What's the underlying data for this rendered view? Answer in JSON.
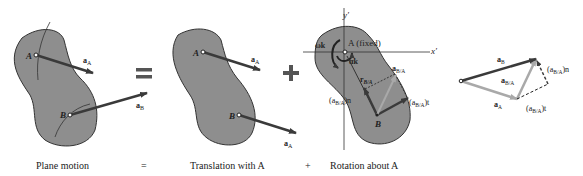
{
  "panels": {
    "plane_motion": {
      "point_a": "A",
      "point_b": "B",
      "accel_a": "a",
      "accel_a_sub": "A",
      "accel_b": "a",
      "accel_b_sub": "B"
    },
    "translation": {
      "point_a": "A",
      "point_b": "B",
      "accel_a": "a",
      "accel_a_sub": "A",
      "accel_b": "a",
      "accel_b_sub": "A"
    },
    "rotation": {
      "axis_x": "x′",
      "axis_y": "y′",
      "fixed_label": "A (fixed)",
      "omega_k": "ωk",
      "alpha_k": "αk",
      "r_ba": "r",
      "r_ba_sub": "B/A",
      "a_ba": "a",
      "a_ba_sub": "B/A",
      "a_ba_n": "(a",
      "a_ba_n_sub": "B/A",
      "a_ba_n_end": ")n",
      "a_ba_t": "(a",
      "a_ba_t_sub": "B/A",
      "a_ba_t_end": ")t",
      "point_b": "B"
    },
    "vector_sum": {
      "a_b": "a",
      "a_b_sub": "B",
      "a_ba": "a",
      "a_ba_sub": "B/A",
      "a_a": "a",
      "a_a_sub": "A",
      "a_ba_n": "(a",
      "a_ba_n_sub": "B/A",
      "a_ba_n_end": ")n",
      "a_ba_t": "(a",
      "a_ba_t_sub": "B/A",
      "a_ba_t_end": ")t"
    }
  },
  "operators": {
    "equals": "=",
    "plus": "+"
  },
  "captions": {
    "plane_motion": "Plane motion",
    "equals": "=",
    "translation": "Translation with A",
    "plus": "+",
    "rotation": "Rotation about A"
  },
  "colors": {
    "body_fill": "#8e8e8e",
    "body_stroke": "#333333",
    "arrow_dark": "#3a3a3a",
    "arrow_light": "#a9a9a9"
  }
}
